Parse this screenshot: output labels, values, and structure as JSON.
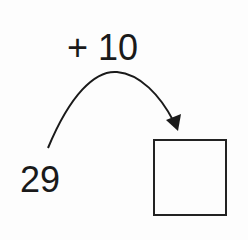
{
  "diagram": {
    "operation_label": "+ 10",
    "start_number": "29",
    "answer_box_value": "",
    "arrow": "curved-jump-arrow"
  }
}
